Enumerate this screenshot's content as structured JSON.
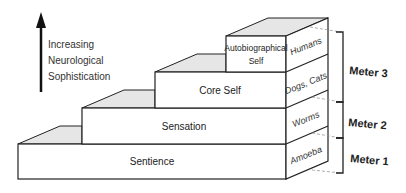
{
  "axis": {
    "label_lines": [
      "Increasing",
      "Neurological",
      "Sophistication"
    ],
    "direction": "up"
  },
  "levels": [
    {
      "name": "Sentience",
      "example": "Amoeba"
    },
    {
      "name": "Sensation",
      "example": "Worms"
    },
    {
      "name": "Core Self",
      "example": "Dogs, Cats"
    },
    {
      "name_lines": [
        "Autobiographical",
        "Self"
      ],
      "example": "Humans"
    }
  ],
  "meters": [
    {
      "label": "Meter 1",
      "spans": [
        "Sentience"
      ]
    },
    {
      "label": "Meter 2",
      "spans": [
        "Sensation"
      ]
    },
    {
      "label": "Meter 3",
      "spans": [
        "Core Self",
        "Autobiographical Self"
      ]
    }
  ],
  "colors": {
    "stroke": "#222222",
    "top_face": "#e6e6e6",
    "front_face": "#ffffff",
    "dashed": "#999999"
  }
}
